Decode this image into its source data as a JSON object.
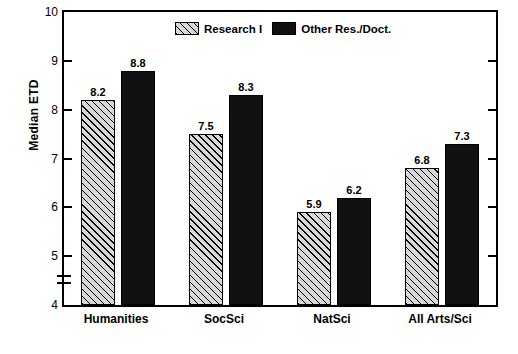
{
  "chart_data": {
    "type": "bar",
    "title": "",
    "xlabel": "",
    "ylabel": "Median ETD",
    "ylim": [
      4,
      10
    ],
    "yticks": [
      4,
      5,
      6,
      7,
      8,
      9,
      10
    ],
    "ytick_labels": [
      "4",
      "5",
      "6",
      "7",
      "8",
      "9",
      "10"
    ],
    "grid": false,
    "legend_position": "top-center",
    "axis_break": true,
    "categories": [
      "Humanities",
      "SocSci",
      "NatSci",
      "All Arts/Sci"
    ],
    "series": [
      {
        "name": "Research I",
        "fill": "hatched",
        "values": [
          8.2,
          7.5,
          5.9,
          6.8
        ],
        "labels": [
          "8.2",
          "7.5",
          "5.9",
          "6.8"
        ]
      },
      {
        "name": "Other Res./Doct.",
        "fill": "solid-black",
        "values": [
          8.8,
          8.3,
          6.2,
          7.3
        ],
        "labels": [
          "8.8",
          "8.3",
          "6.2",
          "7.3"
        ]
      }
    ]
  },
  "legend": {
    "items": [
      {
        "label": "Research I",
        "swatch": "hatched"
      },
      {
        "label": "Other Res./Doct.",
        "swatch": "solid-black"
      }
    ]
  },
  "colors": {
    "axis": "#000000",
    "series1_fill": "#d8d8d8",
    "series2_fill": "#111111",
    "background": "#ffffff"
  }
}
